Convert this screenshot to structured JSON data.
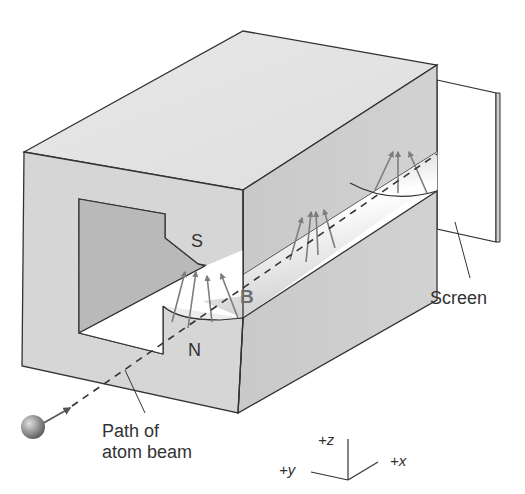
{
  "diagram": {
    "type": "apparatus-illustration",
    "labels": {
      "south_pole": "S",
      "north_pole": "N",
      "field": "B",
      "screen": "Screen",
      "path_line1": "Path of",
      "path_line2": "atom beam"
    },
    "axes": {
      "z": "+z",
      "y": "+y",
      "x": "+x"
    },
    "colors": {
      "magnet_face": "#d6d6d6",
      "magnet_top": "#e4e4e4",
      "magnet_side": "#c8c8c8",
      "cutout": "#b9b9b9",
      "field_arrow": "#7d7d7d",
      "outline": "#333333",
      "atom": "#8a8a8a"
    }
  }
}
